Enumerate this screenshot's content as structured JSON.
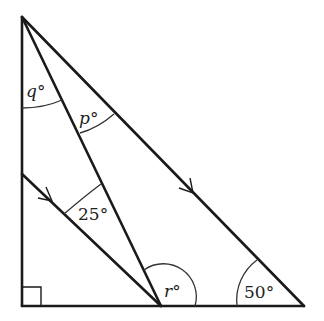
{
  "diagram": {
    "type": "geometry-triangle",
    "colors": {
      "line": "#1a1a1a",
      "label": "#222222",
      "background": "#ffffff"
    },
    "labels": {
      "q": "q°",
      "p": "p°",
      "angle_25": "25°",
      "r": "r°",
      "angle_50": "50°"
    },
    "markers": {
      "right_angle": "bottom-left corner",
      "parallel_arrows": 2
    }
  }
}
